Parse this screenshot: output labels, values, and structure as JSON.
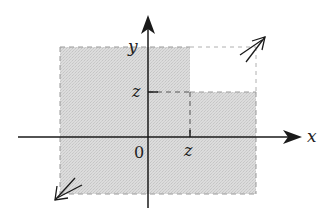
{
  "diagram": {
    "type": "coordinate-plane-region",
    "axes": {
      "x_label": "x",
      "y_label": "y",
      "origin_label": "0"
    },
    "marks": {
      "x_tick_label": "z",
      "y_tick_label": "z"
    },
    "region": {
      "description": "Shaded region extending infinitely toward negative x/y and to the right/up, excluding the quadrant where x > z and y > z",
      "fill_color": "#d9d9d9",
      "excluded_box": "x > z and y > z"
    },
    "colors": {
      "axis": "#1a1a1a",
      "shade": "#d6d6d6",
      "dash": "#9a9a9a",
      "background": "#ffffff"
    }
  }
}
